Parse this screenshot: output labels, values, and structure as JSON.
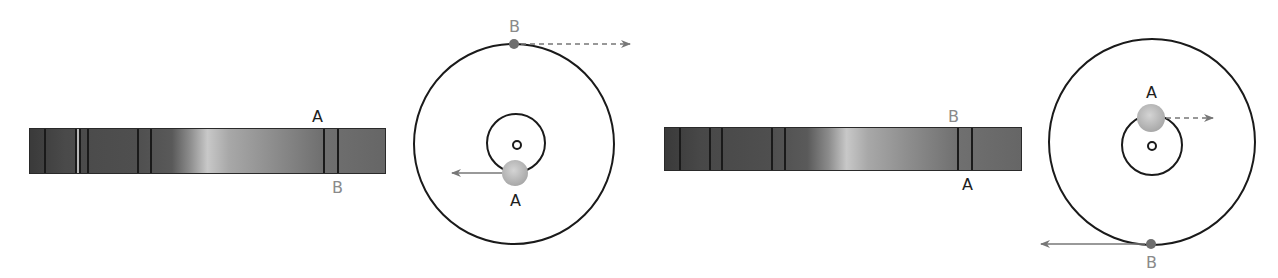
{
  "panels": [
    {
      "id": "left",
      "spectrum": {
        "x": 29,
        "y": 128,
        "width": 357,
        "height": 46,
        "lines": [
          14,
          45,
          49,
          57,
          107,
          120,
          293,
          307
        ],
        "light_lines": [
          47
        ],
        "label_top": "A",
        "label_bottom": "B",
        "label_top_x": 312,
        "label_bottom_x": 332
      },
      "orbit": {
        "cx": 514,
        "cy": 144,
        "outer_r": 100,
        "inner_r": 29,
        "center_r": 4,
        "inner_cx": 516,
        "inner_cy": 143,
        "body_a": {
          "label": "A",
          "x": 515,
          "y": 173,
          "r": 13
        },
        "body_b": {
          "label": "B",
          "x": 514,
          "y": 44,
          "r": 5
        },
        "arrow_a": {
          "x1": 502,
          "y1": 173,
          "x2": 452,
          "y2": 173,
          "style": "solid"
        },
        "arrow_b": {
          "x1": 521,
          "y1": 44,
          "x2": 630,
          "y2": 44,
          "style": "dashed"
        }
      }
    },
    {
      "id": "right",
      "spectrum": {
        "x": 664,
        "y": 127,
        "width": 358,
        "height": 44,
        "lines": [
          14,
          44,
          56,
          106,
          119,
          292,
          306
        ],
        "light_lines": [],
        "label_top": "B",
        "label_bottom": "A",
        "label_top_x": 298,
        "label_bottom_x": 312
      },
      "orbit": {
        "cx": 1152,
        "cy": 144,
        "outer_r": 103,
        "inner_r": 30,
        "center_r": 4,
        "inner_cx": 1152,
        "inner_cy": 145,
        "body_a": {
          "label": "A",
          "x": 1151,
          "y": 118,
          "r": 14
        },
        "body_b": {
          "label": "B",
          "x": 1151,
          "y": 244,
          "r": 5
        },
        "arrow_a": {
          "x1": 1166,
          "y1": 118,
          "x2": 1213,
          "y2": 118,
          "style": "dashed"
        },
        "arrow_b": {
          "x1": 1145,
          "y1": 244,
          "x2": 1041,
          "y2": 244,
          "style": "solid"
        }
      }
    }
  ],
  "colors": {
    "stroke": "#1a1a1a",
    "arrow": "#777777",
    "body_a": "#bdbdbd",
    "body_b": "#6e6e6e",
    "label_a": "#1e1e1e",
    "label_b": "#8a8a8a"
  }
}
